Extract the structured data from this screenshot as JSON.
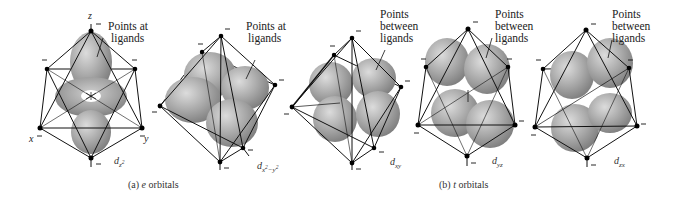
{
  "figure": {
    "panels": [
      {
        "id": "dz2",
        "orbital_label": "d",
        "orbital_sub": "z",
        "orbital_sup": "2",
        "annotation": [
          "Points at",
          "ligands"
        ],
        "axes": {
          "x": "x",
          "y": "y",
          "z": "z"
        }
      },
      {
        "id": "dx2-y2",
        "orbital_label": "d",
        "orbital_sub": "x",
        "orbital_sub_sup": "2",
        "orbital_sub_rest": "−y",
        "orbital_sub_sup2": "2",
        "annotation": [
          "Points at",
          "ligands"
        ]
      },
      {
        "id": "dxy",
        "orbital_label": "d",
        "orbital_sub": "xy",
        "annotation": [
          "Points",
          "between",
          "ligands"
        ]
      },
      {
        "id": "dyz",
        "orbital_label": "d",
        "orbital_sub": "yz",
        "annotation": [
          "Points",
          "between",
          "ligands"
        ]
      },
      {
        "id": "dzx",
        "orbital_label": "d",
        "orbital_sub": "zx",
        "annotation": [
          "Points",
          "between",
          "ligands"
        ]
      }
    ],
    "captions": {
      "a_prefix": "(a)",
      "a_symbol": "e",
      "a_text": "orbitals",
      "b_prefix": "(b)",
      "b_symbol": "t",
      "b_text": "orbitals"
    },
    "ligand_charge": "−",
    "colors": {
      "lobe": "#a9a9a9",
      "lobe_highlight": "#d6d6d6",
      "lobe_shadow": "#7a7a7a",
      "line": "#111111",
      "ligand": "#000000"
    }
  }
}
